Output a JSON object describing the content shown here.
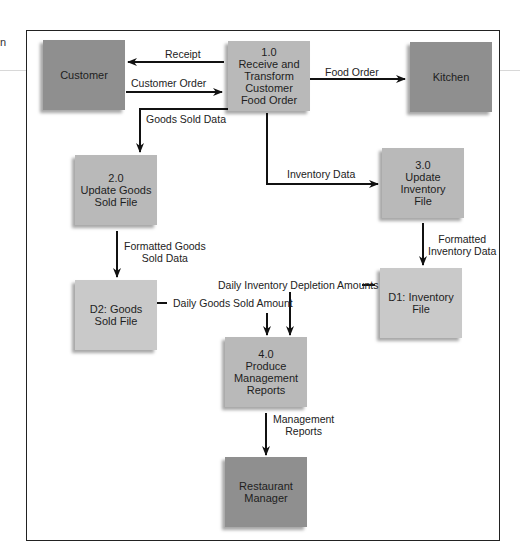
{
  "page_fragment": "n",
  "nodes": {
    "customer": {
      "label": "Customer",
      "type": "external-entity"
    },
    "p1": {
      "label": "1.0\nReceive and\nTransform\nCustomer\nFood Order",
      "type": "process"
    },
    "kitchen": {
      "label": "Kitchen",
      "type": "external-entity"
    },
    "p2": {
      "label": "2.0\nUpdate Goods\nSold File",
      "type": "process"
    },
    "p3": {
      "label": "3.0\nUpdate\nInventory\nFile",
      "type": "process"
    },
    "d2": {
      "label": "D2: Goods\nSold File",
      "type": "data-store"
    },
    "d1": {
      "label": "D1: Inventory\nFile",
      "type": "data-store"
    },
    "p4": {
      "label": "4.0\nProduce\nManagement\nReports",
      "type": "process"
    },
    "manager": {
      "label": "Restaurant\nManager",
      "type": "external-entity"
    }
  },
  "flows": {
    "receipt": {
      "label": "Receipt",
      "from": "p1",
      "to": "customer"
    },
    "customer_order": {
      "label": "Customer Order",
      "from": "customer",
      "to": "p1"
    },
    "food_order": {
      "label": "Food Order",
      "from": "p1",
      "to": "kitchen"
    },
    "goods_sold_data": {
      "label": "Goods Sold Data",
      "from": "p1",
      "to": "p2"
    },
    "inventory_data": {
      "label": "Inventory Data",
      "from": "p1",
      "to": "p3"
    },
    "formatted_goods": {
      "label": "Formatted Goods\nSold Data",
      "from": "p2",
      "to": "d2"
    },
    "formatted_inventory": {
      "label": "Formatted\nInventory Data",
      "from": "p3",
      "to": "d1"
    },
    "daily_depletion": {
      "label": "Daily Inventory Depletion Amounts",
      "from": "d1",
      "to": "p4"
    },
    "daily_goods": {
      "label": "Daily Goods Sold Amount",
      "from": "d2",
      "to": "p4"
    },
    "mgmt_reports": {
      "label": "Management\nReports",
      "from": "p4",
      "to": "manager"
    }
  },
  "colors": {
    "entity": "#8f8f8f",
    "process": "#b9b9b9",
    "store": "#c9c9c9",
    "line": "#111111"
  }
}
